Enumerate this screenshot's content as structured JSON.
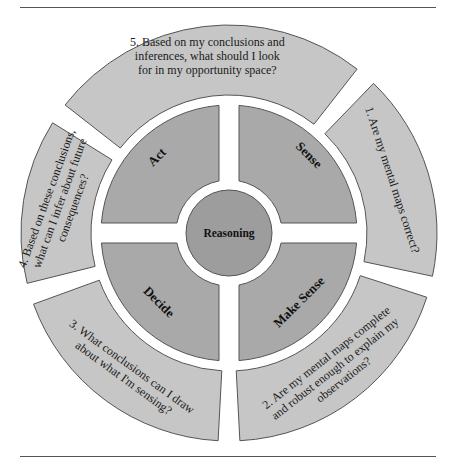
{
  "diagram": {
    "center_label": "Reasoning",
    "stages": [
      {
        "id": "sense",
        "label": "Sense"
      },
      {
        "id": "make-sense",
        "label": "Make Sense"
      },
      {
        "id": "decide",
        "label": "Decide"
      },
      {
        "id": "act",
        "label": "Act"
      }
    ],
    "questions": [
      {
        "number": 1,
        "lines": [
          "1. Are my mental maps correct?"
        ]
      },
      {
        "number": 2,
        "lines": [
          "2. Are my mental maps complete",
          "and robust enough to explain my",
          "observations?"
        ]
      },
      {
        "number": 3,
        "lines": [
          "3. What conclusions can I draw",
          "about what I'm sensing?"
        ]
      },
      {
        "number": 4,
        "lines": [
          "4. Based on these conclusions,",
          "what can I infer about future",
          "consequences?"
        ]
      },
      {
        "number": 5,
        "lines": [
          "5. Based on my conclusions and",
          "inferences, what should I look",
          "for in my opportunity space?"
        ]
      }
    ],
    "colors": {
      "outer_ring": "#c6c6c6",
      "inner_quadrants": "#a9a9a9",
      "center": "#9d9d9d",
      "outline": "#555555",
      "background": "#ffffff"
    }
  }
}
